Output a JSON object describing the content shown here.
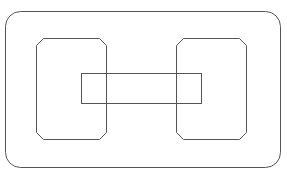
{
  "diagram": {
    "width": 287,
    "height": 181,
    "background": "#ffffff",
    "stroke_color": "#555555",
    "stroke_width": 1,
    "shapes": {
      "outer_frame": {
        "type": "rounded-rect",
        "x": 5.5,
        "y": 11.5,
        "w": 275,
        "h": 156,
        "r": 15
      },
      "left_block": {
        "type": "octagon",
        "x": 36.5,
        "y": 38.5,
        "w": 70,
        "h": 101,
        "chamfer": 7
      },
      "right_block": {
        "type": "octagon",
        "x": 176.5,
        "y": 38.5,
        "w": 70,
        "h": 101,
        "chamfer": 7
      },
      "connector_bar": {
        "type": "rect",
        "x": 81.5,
        "y": 73.5,
        "w": 120,
        "h": 30
      }
    }
  }
}
